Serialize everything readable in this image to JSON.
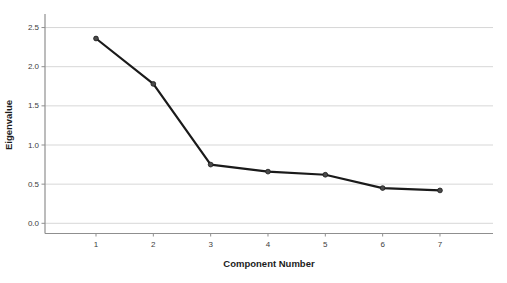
{
  "chart_data": {
    "type": "line",
    "title": "",
    "xlabel": "Component Number",
    "ylabel": "Eigenvalue",
    "x": [
      1,
      2,
      3,
      4,
      5,
      6,
      7
    ],
    "values": [
      2.36,
      1.78,
      0.75,
      0.66,
      0.62,
      0.45,
      0.42
    ],
    "series": [
      {
        "name": "Eigenvalue",
        "values": [
          2.36,
          1.78,
          0.75,
          0.66,
          0.62,
          0.45,
          0.42
        ]
      }
    ],
    "xticks": [
      "1",
      "2",
      "3",
      "4",
      "5",
      "6",
      "7"
    ],
    "yticks": [
      0.0,
      0.5,
      1.0,
      1.5,
      2.0,
      2.5
    ],
    "ytick_labels": [
      "0.0",
      "0.5",
      "1.0",
      "1.5",
      "2.0",
      "2.5"
    ],
    "ylim": [
      -0.13,
      2.8
    ],
    "xlim": [
      0.1,
      7.9
    ],
    "grid": "horizontal-only",
    "legend": "none",
    "marker": "circle",
    "colors": {
      "background": "#ffffff",
      "line": "#1a1a1a",
      "marker_fill": "#4a4a4a",
      "marker_edge": "#1a1a1a",
      "grid": "#d7d7d7",
      "axis": "#8f8f8f",
      "tick_label": "#3d3d3d",
      "axis_title": "#1c1c1c"
    }
  }
}
